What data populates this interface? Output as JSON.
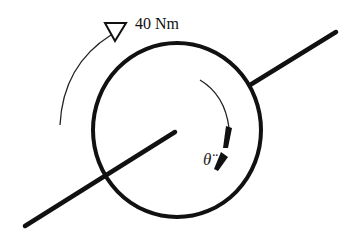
{
  "diagram": {
    "type": "free-body diagram",
    "applied_torque": {
      "label": "40 Nm",
      "direction": "counterclockwise-arc-to-top"
    },
    "angular_acceleration": {
      "label": "θ̈",
      "direction": "clockwise"
    },
    "colors": {
      "stroke": "#111111",
      "background": "#ffffff"
    }
  }
}
